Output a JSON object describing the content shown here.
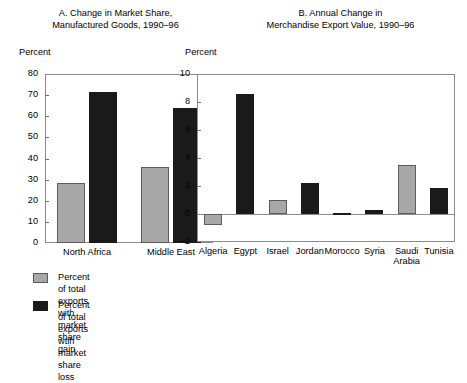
{
  "panel_a": {
    "title": "A. Change in Market Share,\nManufactured Goods, 1990–96",
    "axis_unit": "Percent"
  },
  "panel_b": {
    "title": "B. Annual Change in\nMerchandise Export Value, 1990–96",
    "axis_unit": "Percent"
  },
  "legend": {
    "items": [
      {
        "swatch": "#a8a8a8",
        "label": "Percent of total exports with\nmarket share gain"
      },
      {
        "swatch": "#1a1a1a",
        "label": "Percent of total exports wtih\nmarket share loss"
      }
    ]
  },
  "colors": {
    "gain": "#a8a8a8",
    "loss": "#1a1a1a",
    "frame": "#8c8c8c",
    "background": "#ffffff"
  },
  "chart_data": [
    {
      "type": "bar",
      "title": "A. Change in Market Share, Manufactured Goods, 1990–96",
      "xlabel": "",
      "ylabel": "Percent",
      "ylim": [
        0,
        80
      ],
      "yticks": [
        0,
        10,
        20,
        30,
        40,
        50,
        60,
        70,
        80
      ],
      "ytick_labels": [
        "0",
        "10",
        "20",
        "30",
        "40",
        "50",
        "60",
        "70",
        "80"
      ],
      "grid": false,
      "legend_position": "below-left",
      "categories": [
        "North Africa",
        "Middle East"
      ],
      "series": [
        {
          "name": "Percent of total exports with market share gain",
          "color": "#a8a8a8",
          "values": [
            28.5,
            36.0
          ]
        },
        {
          "name": "Percent of total exports wtih market share loss",
          "color": "#1a1a1a",
          "values": [
            71.5,
            64.0
          ]
        }
      ]
    },
    {
      "type": "bar",
      "title": "B. Annual Change in Merchandise Export Value, 1990–96",
      "xlabel": "",
      "ylabel": "Percent",
      "ylim": [
        -2,
        10
      ],
      "yticks": [
        -2,
        0,
        2,
        4,
        6,
        8,
        10
      ],
      "ytick_labels": [
        "–2",
        "0",
        "2",
        "4",
        "6",
        "8",
        "10"
      ],
      "grid": false,
      "legend_position": "shared-with-panel-a",
      "categories": [
        "Algeria",
        "Egypt",
        "Israel",
        "Jordan",
        "Morocco",
        "Syria",
        "Saudi\nArabia",
        "Tunisia"
      ],
      "values": [
        -0.8,
        8.6,
        1.0,
        2.2,
        0.1,
        0.3,
        3.5,
        1.85
      ],
      "bar_colors": [
        "#a8a8a8",
        "#1a1a1a",
        "#a8a8a8",
        "#1a1a1a",
        "#1a1a1a",
        "#1a1a1a",
        "#a8a8a8",
        "#1a1a1a"
      ]
    }
  ]
}
